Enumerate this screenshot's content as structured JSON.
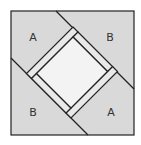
{
  "diagram": {
    "type": "quilt-block",
    "colors": {
      "background": "#ffffff",
      "outer_fill": "#d9d9d9",
      "strip_fill": "#e9e9e9",
      "center_fill": "#f3f3f3",
      "line": "#222222",
      "label": "#333333"
    },
    "labels": {
      "top_left": "A",
      "top_right": "B",
      "bottom_left": "B",
      "bottom_right": "A"
    }
  }
}
